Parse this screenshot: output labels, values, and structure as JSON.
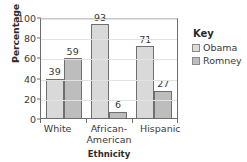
{
  "chart_data": {
    "type": "bar",
    "title": "",
    "xlabel": "Ethnicity",
    "ylabel": "Percentage",
    "ylim": [
      0,
      100
    ],
    "yticks": [
      0,
      20,
      40,
      60,
      80,
      100
    ],
    "grid": true,
    "legend_position": "right",
    "legend_title": "Key",
    "categories": [
      "White",
      "African-American",
      "Hispanic"
    ],
    "category_lines": [
      [
        "White"
      ],
      [
        "African-",
        "American"
      ],
      [
        "Hispanic"
      ]
    ],
    "series": [
      {
        "name": "Obama",
        "values": [
          39,
          93,
          71
        ],
        "color": "#d9d9d9"
      },
      {
        "name": "Romney",
        "values": [
          59,
          6,
          27
        ],
        "color": "#bdbdbd"
      }
    ],
    "data_labels": [
      "39",
      "59",
      "93",
      "6",
      "71",
      "27"
    ]
  },
  "axes": {
    "y_title": "Percentage",
    "x_title": "Ethnicity",
    "y_tick_labels": [
      "100",
      "80",
      "60",
      "40",
      "20",
      "0"
    ]
  },
  "legend": {
    "title": "Key",
    "items": [
      {
        "label": "Obama"
      },
      {
        "label": "Romney"
      }
    ]
  }
}
